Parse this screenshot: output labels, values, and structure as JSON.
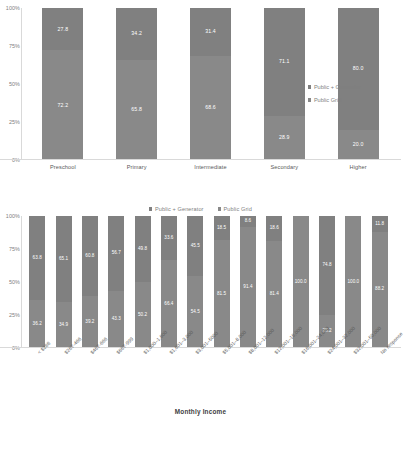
{
  "colors": {
    "public_generator": "#808080",
    "public_grid": "#898989",
    "axis": "#d9d9d9",
    "text": "#595959",
    "label_text": "#ffffff"
  },
  "legend": {
    "series_1": "Public + Generator",
    "series_2": "Public Grid"
  },
  "y_ticks": [
    "100%",
    "75%",
    "50%",
    "25%",
    "0%"
  ],
  "bottom_axis_title": "Monthly Income",
  "chart_data": [
    {
      "type": "bar",
      "stacked": true,
      "title": "",
      "xlabel": "",
      "ylabel": "",
      "ylim": [
        0,
        100
      ],
      "grid": false,
      "legend_position": "right",
      "categories": [
        "Preschool",
        "Primary",
        "Intermediate",
        "Secondary",
        "Higher"
      ],
      "series": [
        {
          "name": "Public + Generator",
          "values": [
            27.8,
            34.2,
            31.4,
            71.1,
            80.0
          ]
        },
        {
          "name": "Public Grid",
          "values": [
            72.2,
            65.8,
            68.6,
            28.9,
            20.0
          ]
        }
      ],
      "tick_labels": [
        "100%",
        "75%",
        "50%",
        "25%",
        "0%"
      ]
    },
    {
      "type": "bar",
      "stacked": true,
      "title": "",
      "xlabel": "Monthly Income",
      "ylabel": "",
      "ylim": [
        0,
        100
      ],
      "grid": false,
      "legend_position": "top",
      "categories": [
        "< $266",
        "$267-466",
        "$467-666",
        "$667-999",
        "$1,000–1,600",
        "$1,601–3,000",
        "$3,001–5000",
        "$5,001–8,000",
        "$8,001–12,000",
        "$12,001–16,000",
        "$16,001–24,000",
        "$24,001–32,000",
        "$32,001–50,000",
        "No response"
      ],
      "series": [
        {
          "name": "Public + Generator",
          "values": [
            63.8,
            65.1,
            60.8,
            56.7,
            49.8,
            33.6,
            45.5,
            18.5,
            8.6,
            18.6,
            0.0,
            74.8,
            0.0,
            11.8
          ]
        },
        {
          "name": "Public Grid",
          "values": [
            36.2,
            34.9,
            39.2,
            43.3,
            50.2,
            66.4,
            54.5,
            81.5,
            91.4,
            81.4,
            100.0,
            25.2,
            100.0,
            88.2
          ]
        }
      ],
      "tick_labels": [
        "100%",
        "75%",
        "50%",
        "25%",
        "0%"
      ]
    }
  ]
}
